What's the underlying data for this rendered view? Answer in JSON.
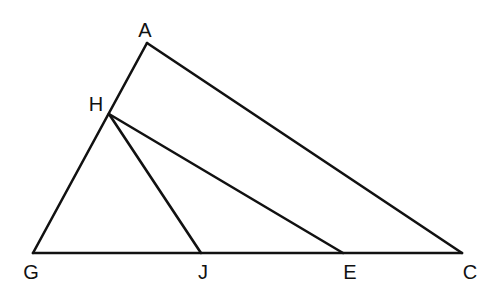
{
  "diagram": {
    "type": "geometry-triangle",
    "points": {
      "A": {
        "label": "A",
        "x": 147,
        "y": 43,
        "lx": 145,
        "ly": 37
      },
      "H": {
        "label": "H",
        "x": 109,
        "y": 114,
        "lx": 96,
        "ly": 111
      },
      "G": {
        "label": "G",
        "x": 33,
        "y": 253,
        "lx": 31,
        "ly": 279
      },
      "J": {
        "label": "J",
        "x": 201,
        "y": 253,
        "lx": 203,
        "ly": 279
      },
      "E": {
        "label": "E",
        "x": 343,
        "y": 253,
        "lx": 350,
        "ly": 279
      },
      "C": {
        "label": "C",
        "x": 462,
        "y": 253,
        "lx": 470,
        "ly": 279
      }
    },
    "segments": [
      {
        "name": "segment-ga",
        "from": "G",
        "to": "A"
      },
      {
        "name": "segment-ac",
        "from": "A",
        "to": "C"
      },
      {
        "name": "segment-gc",
        "from": "G",
        "to": "C"
      },
      {
        "name": "segment-he",
        "from": "H",
        "to": "E"
      },
      {
        "name": "segment-hj",
        "from": "H",
        "to": "J"
      }
    ],
    "stroke_color": "#111111"
  }
}
